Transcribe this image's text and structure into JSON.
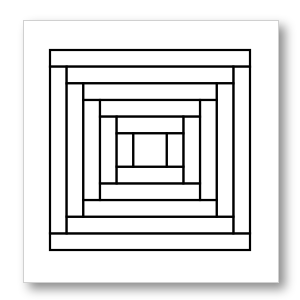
{
  "artwork": {
    "subject": "log-cabin quilt block",
    "rings": 6,
    "stroke_color": "#000000",
    "fill_color": "#ffffff",
    "card_background": "#ffffff",
    "card_border_color": "#d0d0d0"
  }
}
